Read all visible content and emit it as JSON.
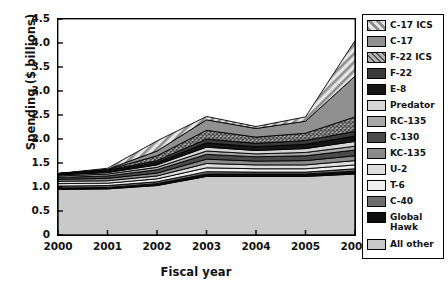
{
  "chart_data": {
    "type": "area",
    "title": "",
    "xlabel": "Fiscal year",
    "ylabel": "Spending ($ billions)",
    "categories": [
      "2000",
      "2001",
      "2002",
      "2003",
      "2004",
      "2005",
      "2006"
    ],
    "x": [
      2000,
      2001,
      2002,
      2003,
      2004,
      2005,
      2006
    ],
    "xlim": [
      2000,
      2006
    ],
    "ylim": [
      0,
      4.5
    ],
    "yticks": [
      "0",
      "0.5",
      "1.0",
      "1.5",
      "2.0",
      "2.5",
      "3.0",
      "3.5",
      "4.0",
      "4.5"
    ],
    "ytick_values": [
      0,
      0.5,
      1.0,
      1.5,
      2.0,
      2.5,
      3.0,
      3.5,
      4.0,
      4.5
    ],
    "grid": false,
    "stacked": true,
    "legend_position": "right",
    "totals": [
      1.28,
      1.39,
      1.96,
      2.67,
      2.46,
      2.66,
      4.05
    ],
    "series": [
      {
        "name": "All other",
        "order": 1,
        "fill": "#c9c9c9",
        "pattern": "solid",
        "values": [
          0.95,
          0.96,
          1.03,
          1.22,
          1.22,
          1.22,
          1.27
        ]
      },
      {
        "name": "Global Hawk",
        "order": 2,
        "fill": "#0d0d0d",
        "pattern": "solid",
        "values": [
          0.03,
          0.03,
          0.04,
          0.05,
          0.05,
          0.05,
          0.06
        ]
      },
      {
        "name": "C-40",
        "order": 3,
        "fill": "#6e6e6e",
        "pattern": "solid",
        "values": [
          0.04,
          0.04,
          0.04,
          0.05,
          0.04,
          0.04,
          0.05
        ]
      },
      {
        "name": "T-6",
        "order": 4,
        "fill": "#efefef",
        "pattern": "solid",
        "values": [
          0.05,
          0.05,
          0.06,
          0.08,
          0.07,
          0.07,
          0.08
        ]
      },
      {
        "name": "U-2",
        "order": 5,
        "fill": "#dedede",
        "pattern": "solid",
        "values": [
          0.05,
          0.05,
          0.06,
          0.09,
          0.08,
          0.08,
          0.09
        ]
      },
      {
        "name": "KC-135",
        "order": 6,
        "fill": "#8a8a8a",
        "pattern": "solid",
        "values": [
          0.04,
          0.05,
          0.06,
          0.09,
          0.08,
          0.09,
          0.1
        ]
      },
      {
        "name": "C-130",
        "order": 7,
        "fill": "#4a4a4a",
        "pattern": "solid",
        "values": [
          0.04,
          0.05,
          0.07,
          0.1,
          0.09,
          0.1,
          0.12
        ]
      },
      {
        "name": "RC-135",
        "order": 8,
        "fill": "#a8a8a8",
        "pattern": "solid",
        "values": [
          0.03,
          0.04,
          0.05,
          0.07,
          0.06,
          0.07,
          0.08
        ]
      },
      {
        "name": "Predator",
        "order": 9,
        "fill": "#d6d6d6",
        "pattern": "solid",
        "values": [
          0.02,
          0.03,
          0.05,
          0.08,
          0.07,
          0.08,
          0.1
        ]
      },
      {
        "name": "E-8",
        "order": 10,
        "fill": "#161616",
        "pattern": "solid",
        "values": [
          0.02,
          0.03,
          0.05,
          0.09,
          0.08,
          0.09,
          0.11
        ]
      },
      {
        "name": "F-22",
        "order": 11,
        "fill": "#3a3a3a",
        "pattern": "solid",
        "values": [
          0.01,
          0.02,
          0.04,
          0.08,
          0.07,
          0.08,
          0.1
        ]
      },
      {
        "name": "F-22 ICS",
        "order": 12,
        "fill": "#777777",
        "pattern": "crosshatch",
        "values": [
          0.0,
          0.01,
          0.1,
          0.18,
          0.13,
          0.15,
          0.3
        ]
      },
      {
        "name": "C-17",
        "order": 13,
        "fill": "#909090",
        "pattern": "solid",
        "values": [
          0.0,
          0.01,
          0.1,
          0.22,
          0.18,
          0.25,
          0.85
        ]
      },
      {
        "name": "C-17 ICS",
        "order": 14,
        "fill": "#d9d9d9",
        "pattern": "diagonal",
        "values": [
          0.0,
          0.02,
          0.21,
          0.07,
          0.04,
          0.09,
          0.74
        ]
      }
    ]
  },
  "legend": {
    "items": [
      {
        "label": "C-17 ICS",
        "swatch": "c17ics-swatch"
      },
      {
        "label": "C-17",
        "swatch": "c17-swatch"
      },
      {
        "label": "F-22 ICS",
        "swatch": "f22ics-swatch"
      },
      {
        "label": "F-22",
        "swatch": "f22-swatch"
      },
      {
        "label": "E-8",
        "swatch": "e8-swatch"
      },
      {
        "label": "Predator",
        "swatch": "predator-swatch"
      },
      {
        "label": "RC-135",
        "swatch": "rc135-swatch"
      },
      {
        "label": "C-130",
        "swatch": "c130-swatch"
      },
      {
        "label": "KC-135",
        "swatch": "kc135-swatch"
      },
      {
        "label": "U-2",
        "swatch": "u2-swatch"
      },
      {
        "label": "T-6",
        "swatch": "t6-swatch"
      },
      {
        "label": "C-40",
        "swatch": "c40-swatch"
      },
      {
        "label": "Global\nHawk",
        "swatch": "globalhawk-swatch"
      },
      {
        "label": "All other",
        "swatch": "allother-swatch"
      }
    ]
  },
  "colors": {
    "axis": "#000000",
    "text": "#111111",
    "plot_background": "#ffffff",
    "legend_border": "#000000"
  }
}
